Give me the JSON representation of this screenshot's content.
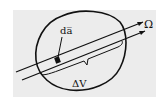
{
  "diagram": {
    "labels": {
      "area_element": "da̅",
      "direction": "Ω",
      "volume": "ΔV"
    },
    "colors": {
      "background": "#ececec",
      "stroke": "#111111"
    }
  }
}
